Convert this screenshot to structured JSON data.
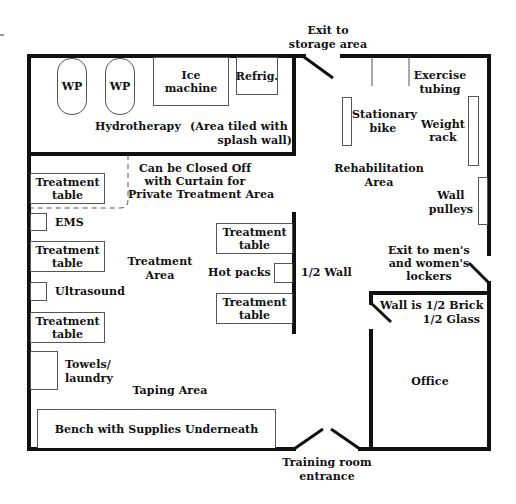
{
  "hydrotherapy": {
    "whirlpool_1": "WP",
    "whirlpool_2": "WP",
    "ice_machine": "Ice machine",
    "refrigerator": "Refrig.",
    "room_label": "Hydrotherapy",
    "note_line1": "(Area tiled with",
    "note_line2": "splash wall)"
  },
  "exits": {
    "storage_line1": "Exit to",
    "storage_line2": "storage area",
    "lockers_line1": "Exit to men's",
    "lockers_line2": "and women's",
    "lockers_line3": "lockers",
    "entrance_line1": "Training room",
    "entrance_line2": "entrance"
  },
  "rehabilitation": {
    "area_line1": "Rehabilitation",
    "area_line2": "Area",
    "stationary_bike_line1": "Stationary",
    "stationary_bike_line2": "bike",
    "exercise_tubing_line1": "Exercise",
    "exercise_tubing_line2": "tubing",
    "weight_rack_line1": "Weight",
    "weight_rack_line2": "rack",
    "wall_pulleys_line1": "Wall",
    "wall_pulleys_line2": "pulleys"
  },
  "treatment": {
    "curtain_line1": "Can be Closed Off",
    "curtain_line2": "with Curtain for",
    "curtain_line3": "Private Treatment Area",
    "table_line1": "Treatment",
    "table_line2": "table",
    "ems": "EMS",
    "ultrasound": "Ultrasound",
    "area_line1": "Treatment",
    "area_line2": "Area",
    "hot_packs": "Hot packs",
    "half_wall": "1/2 Wall",
    "towels_line1": "Towels/",
    "towels_line2": "laundry"
  },
  "taping": {
    "area": "Taping Area",
    "bench": "Bench with Supplies Underneath"
  },
  "office": {
    "label": "Office",
    "wall_note_line1": "Wall is 1/2 Brick",
    "wall_note_line2": "1/2 Glass"
  }
}
